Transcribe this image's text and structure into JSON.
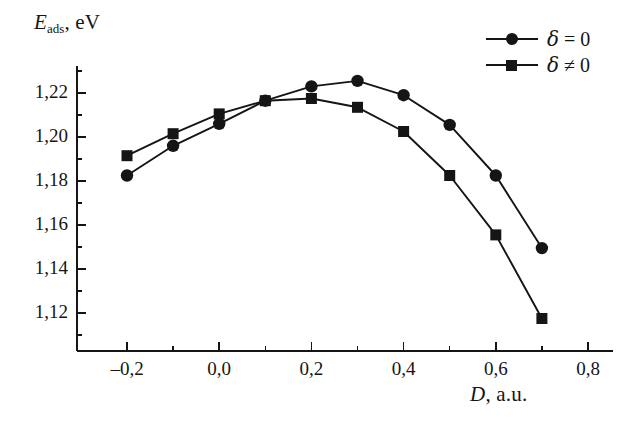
{
  "axes": {
    "y_title_symbol": "E",
    "y_title_sub": "ads",
    "y_title_unit": ", eV",
    "x_title_symbol": "D",
    "x_title_unit": ", a.u.",
    "y_ticks": [
      "1,22",
      "1,20",
      "1,18",
      "1,16",
      "1,14",
      "1,12"
    ],
    "x_ticks": [
      "–0,2",
      "0,0",
      "0,2",
      "0,4",
      "0,6",
      "0,8"
    ]
  },
  "legend": {
    "items": [
      {
        "label_symbol": "δ",
        "label_rel": " = ",
        "label_value": "0",
        "marker": "circle",
        "text": "δ = 0"
      },
      {
        "label_symbol": "δ",
        "label_rel": " ≠ ",
        "label_value": "0",
        "marker": "square",
        "text": "δ ≠ 0"
      }
    ]
  },
  "colors": {
    "ink": "#151515",
    "background": "#ffffff"
  },
  "chart_data": {
    "type": "line",
    "title": "",
    "xlabel": "D, a.u.",
    "ylabel": "E_ads, eV",
    "xlim": [
      -0.25,
      0.82
    ],
    "ylim": [
      1.108,
      1.232
    ],
    "xticks": [
      -0.2,
      0.0,
      0.2,
      0.4,
      0.6,
      0.8
    ],
    "xticks_minor": [
      -0.1,
      0.1,
      0.3,
      0.5,
      0.7
    ],
    "yticks": [
      1.22,
      1.2,
      1.18,
      1.16,
      1.14,
      1.12
    ],
    "yticks_minor": [
      1.23,
      1.21,
      1.19,
      1.17,
      1.15,
      1.13,
      1.11
    ],
    "grid": false,
    "legend_position": "top-right",
    "x": [
      -0.2,
      -0.1,
      0.0,
      0.1,
      0.2,
      0.3,
      0.4,
      0.5,
      0.6,
      0.7
    ],
    "series": [
      {
        "name": "δ = 0",
        "marker": "circle",
        "values": [
          1.1825,
          1.196,
          1.206,
          1.2165,
          1.223,
          1.2255,
          1.219,
          1.2055,
          1.1825,
          1.1495
        ]
      },
      {
        "name": "δ ≠ 0",
        "marker": "square",
        "values": [
          1.1915,
          1.2015,
          1.2105,
          1.2165,
          1.2175,
          1.2135,
          1.2025,
          1.1825,
          1.1555,
          1.1175
        ]
      }
    ]
  }
}
